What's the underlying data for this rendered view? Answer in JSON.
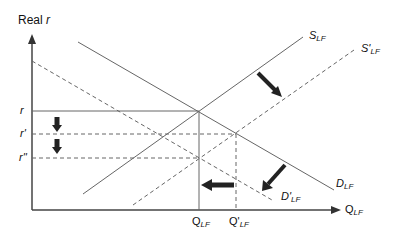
{
  "diagram": {
    "y_axis": {
      "label_prefix": "Real ",
      "label_var": "r"
    },
    "x_axis": {
      "label_main": "Q",
      "label_sub": "LF"
    },
    "curves": [
      {
        "id": "S_LF",
        "label_main": "S",
        "label_sub": "LF",
        "style": "solid"
      },
      {
        "id": "S_prime_LF",
        "label_main": "S'",
        "label_sub": "LF",
        "style": "dashed"
      },
      {
        "id": "D_LF",
        "label_main": "D",
        "label_sub": "LF",
        "style": "solid"
      },
      {
        "id": "D_prime_LF",
        "label_main": "D'",
        "label_sub": "LF",
        "style": "dashed"
      }
    ],
    "y_ticks": [
      {
        "id": "r",
        "label": "r"
      },
      {
        "id": "r_prime",
        "label": "r'"
      },
      {
        "id": "r_double_prime",
        "label": "r''"
      }
    ],
    "x_ticks": [
      {
        "id": "Q_LF",
        "label_main": "Q",
        "label_sub": "LF"
      },
      {
        "id": "Q_prime_LF",
        "label_main": "Q'",
        "label_sub": "LF"
      }
    ],
    "arrows": [
      {
        "id": "supply-shift-arrow",
        "direction": "down-right"
      },
      {
        "id": "demand-shift-arrow",
        "direction": "down-left"
      },
      {
        "id": "quantity-shift-arrow",
        "direction": "left"
      },
      {
        "id": "rate-drop-arrow-1",
        "direction": "down"
      },
      {
        "id": "rate-drop-arrow-2",
        "direction": "down"
      }
    ],
    "colors": {
      "line": "#555555",
      "arrow": "#222222",
      "text": "#111111"
    }
  }
}
